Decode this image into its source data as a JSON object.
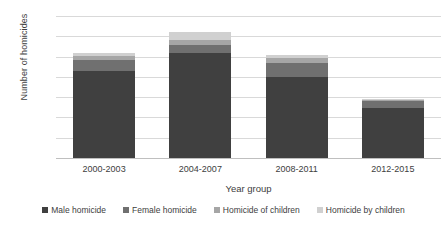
{
  "chart_data": {
    "type": "bar",
    "subtype": "stacked-column",
    "title": "",
    "xlabel": "Year group",
    "ylabel": "Number of homicides",
    "categories": [
      "2000-2003",
      "2004-2007",
      "2008-2011",
      "2012-2015"
    ],
    "series": [
      {
        "name": "Male homicide",
        "color": "#404040",
        "values": [
          430,
          520,
          400,
          245
        ]
      },
      {
        "name": "Female homicide",
        "color": "#707070",
        "values": [
          55,
          35,
          70,
          35
        ]
      },
      {
        "name": "Homicide of children",
        "color": "#a6a6a6",
        "values": [
          20,
          25,
          25,
          8
        ]
      },
      {
        "name": "Homicide by children",
        "color": "#d0d0d0",
        "values": [
          15,
          40,
          15,
          2
        ]
      }
    ],
    "totals": [
      520,
      620,
      510,
      290
    ],
    "ylim": [
      0,
      700
    ],
    "yticks": [
      0,
      100,
      200,
      300,
      400,
      500,
      600,
      700
    ],
    "ytick_labels": [
      "0",
      "100",
      "200",
      "300",
      "400",
      "500",
      "600",
      "700"
    ],
    "grid": true,
    "legend_position": "bottom"
  },
  "legend": {
    "items": [
      {
        "label": "Male homicide",
        "color": "#404040"
      },
      {
        "label": "Female homicide",
        "color": "#707070"
      },
      {
        "label": "Homicide of children",
        "color": "#a6a6a6"
      },
      {
        "label": "Homicide by children",
        "color": "#d0d0d0"
      }
    ]
  }
}
